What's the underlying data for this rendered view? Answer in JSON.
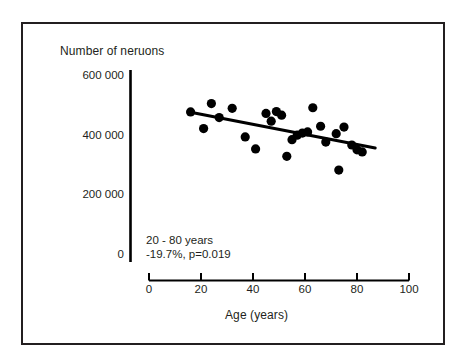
{
  "figure": {
    "border_color": "#231f20",
    "background": "#ffffff",
    "ink_color": "#000000"
  },
  "chart_data": {
    "type": "scatter",
    "title": "",
    "ylabel": "Number of neruons",
    "xlabel": "Age (years)",
    "xlim": [
      0,
      100
    ],
    "ylim": [
      0,
      600000
    ],
    "xticks": [
      0,
      20,
      40,
      60,
      80,
      100
    ],
    "xtick_labels": [
      "0",
      "20",
      "40",
      "60",
      "80",
      "100"
    ],
    "yticks": [
      0,
      200000,
      400000,
      600000
    ],
    "ytick_labels": [
      "0",
      "200 000",
      "400 000",
      "600 000"
    ],
    "grid": false,
    "legend": null,
    "annotations": [
      "20 - 80 years",
      "-19.7%, p=0.019"
    ],
    "marker": {
      "shape": "circle",
      "color": "#000000",
      "radius_px": 4.6
    },
    "points": [
      {
        "x": 16,
        "y": 483000
      },
      {
        "x": 21,
        "y": 427000
      },
      {
        "x": 24,
        "y": 511000
      },
      {
        "x": 27,
        "y": 464000
      },
      {
        "x": 32,
        "y": 495000
      },
      {
        "x": 37,
        "y": 399000
      },
      {
        "x": 41,
        "y": 359000
      },
      {
        "x": 45,
        "y": 478000
      },
      {
        "x": 47,
        "y": 452000
      },
      {
        "x": 49,
        "y": 484000
      },
      {
        "x": 51,
        "y": 472000
      },
      {
        "x": 53,
        "y": 334000
      },
      {
        "x": 55,
        "y": 390000
      },
      {
        "x": 57,
        "y": 405000
      },
      {
        "x": 59,
        "y": 412000
      },
      {
        "x": 61,
        "y": 416000
      },
      {
        "x": 63,
        "y": 497000
      },
      {
        "x": 66,
        "y": 435000
      },
      {
        "x": 68,
        "y": 382000
      },
      {
        "x": 72,
        "y": 410000
      },
      {
        "x": 73,
        "y": 288000
      },
      {
        "x": 75,
        "y": 432000
      },
      {
        "x": 78,
        "y": 372000
      },
      {
        "x": 80,
        "y": 356000
      },
      {
        "x": 82,
        "y": 349000
      }
    ],
    "trendline": {
      "x_start": 16,
      "y_start": 482000,
      "x_end": 87,
      "y_end": 362000,
      "color": "#000000",
      "width_px": 3
    }
  }
}
